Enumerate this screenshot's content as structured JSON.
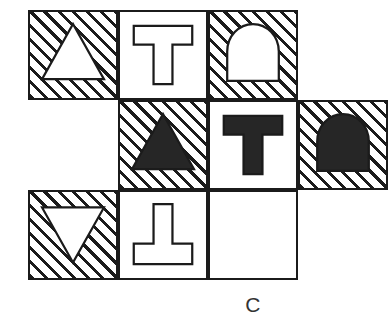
{
  "puzzle": {
    "caption": "C",
    "colors": {
      "ink": "#1b1b1b",
      "paper": "#ffffff",
      "fill_black": "#262626",
      "caption_text": "#333333"
    },
    "grid": {
      "columns": 4,
      "rows": 3,
      "cell_width": 90,
      "cell_height": 90,
      "origin_x": 28,
      "origin_y": 10
    },
    "cells": [
      {
        "id": "cell-r1c1",
        "row": 1,
        "column": 1,
        "background": "hatched",
        "shape": "triangle-up",
        "shape_fill": "white",
        "label": "hatched-cell-white-triangle-up"
      },
      {
        "id": "cell-r1c2",
        "row": 1,
        "column": 2,
        "background": "plain",
        "shape": "tee-up",
        "shape_fill": "white",
        "label": "plain-cell-white-tee"
      },
      {
        "id": "cell-r1c3",
        "row": 1,
        "column": 3,
        "background": "hatched",
        "shape": "dome",
        "shape_fill": "white",
        "label": "hatched-cell-white-dome"
      },
      {
        "id": "cell-r2c2",
        "row": 2,
        "column": 2,
        "background": "hatched",
        "shape": "triangle-up",
        "shape_fill": "black",
        "label": "hatched-cell-black-triangle-up"
      },
      {
        "id": "cell-r2c3",
        "row": 2,
        "column": 3,
        "background": "plain",
        "shape": "tee-up",
        "shape_fill": "black",
        "label": "plain-cell-black-tee"
      },
      {
        "id": "cell-r2c4",
        "row": 2,
        "column": 4,
        "background": "hatched",
        "shape": "dome",
        "shape_fill": "black",
        "label": "hatched-cell-black-dome"
      },
      {
        "id": "cell-r3c1",
        "row": 3,
        "column": 1,
        "background": "hatched",
        "shape": "triangle-down",
        "shape_fill": "white",
        "label": "hatched-cell-white-triangle-down"
      },
      {
        "id": "cell-r3c2",
        "row": 3,
        "column": 2,
        "background": "plain",
        "shape": "tee-down",
        "shape_fill": "white",
        "label": "plain-cell-white-inverted-tee"
      },
      {
        "id": "cell-r3c3",
        "row": 3,
        "column": 3,
        "background": "plain",
        "shape": "none",
        "shape_fill": "none",
        "label": "plain-cell-empty"
      }
    ]
  }
}
